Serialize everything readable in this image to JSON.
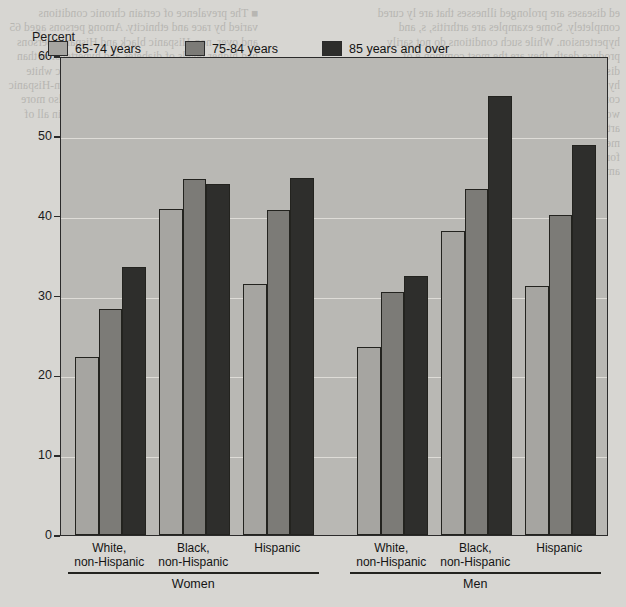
{
  "chart_data": {
    "type": "bar",
    "title": "",
    "xlabel": "",
    "ylabel": "Percent",
    "ylim": [
      0,
      60
    ],
    "yticks": [
      0,
      10,
      20,
      30,
      40,
      50,
      60
    ],
    "grid": true,
    "legend_position": "top-inside",
    "categories": [
      "White, non-Hispanic",
      "Black, non-Hispanic",
      "Hispanic",
      "White, non-Hispanic",
      "Black, non-Hispanic",
      "Hispanic"
    ],
    "panels": [
      {
        "name": "Women",
        "categories": [
          "White, non-Hispanic",
          "Black, non-Hispanic",
          "Hispanic"
        ]
      },
      {
        "name": "Men",
        "categories": [
          "White, non-Hispanic",
          "Black, non-Hispanic",
          "Hispanic"
        ]
      }
    ],
    "series": [
      {
        "name": "65-74 years",
        "color": "#a6a5a1",
        "values": [
          22.3,
          40.8,
          31.5,
          23.6,
          38.1,
          31.2
        ]
      },
      {
        "name": "75-84 years",
        "color": "#7c7b77",
        "values": [
          28.3,
          44.6,
          40.7,
          30.4,
          43.4,
          40.1
        ]
      },
      {
        "name": "85 years and over",
        "color": "#2e2e2c",
        "values": [
          33.6,
          44.0,
          44.7,
          32.5,
          55.0,
          48.9
        ]
      }
    ]
  },
  "axis": {
    "y_title": "Percent",
    "ticks": [
      "60",
      "50",
      "40",
      "30",
      "20",
      "10",
      "0"
    ]
  },
  "legend": {
    "items": [
      {
        "label": "65-74 years"
      },
      {
        "label": "75-84 years"
      },
      {
        "label": "85 years and over"
      }
    ]
  },
  "xaxis": {
    "groups": [
      {
        "line1": "White,",
        "line2": "non-Hispanic"
      },
      {
        "line1": "Black,",
        "line2": "non-Hispanic"
      },
      {
        "line1": "Hispanic",
        "line2": ""
      },
      {
        "line1": "White,",
        "line2": "non-Hispanic"
      },
      {
        "line1": "Black,",
        "line2": "non-Hispanic"
      },
      {
        "line1": "Hispanic",
        "line2": ""
      }
    ],
    "panels": [
      {
        "label": "Women"
      },
      {
        "label": "Men"
      }
    ]
  },
  "colors": {
    "page_background": "#d7d6d2",
    "plot_background": "#b9b8b4",
    "gridline": "#dedcd7",
    "axis": "#23231f",
    "series_65_74": "#a6a5a1",
    "series_75_84": "#7c7b77",
    "series_85_over": "#2e2e2c"
  },
  "bleed_text": {
    "left": "■  The prevalence of certain chronic conditions varied by race and ethnicity. Among persons aged 65 and over, non-Hispanic black and Hispanic persons had higher levels of diabetes and hypertension than non-Hispanic white persons. Non-Hispanic white persons had higher rates of cancer than non-Hispanic black or Hispanic persons. Arthritis was also more common among women than among men in all of the groups examined in this report.",
    "right": "ed diseases are prolonged illnesses that are ly cured completely. Some examples are arthritis, s, and hypertension. While such conditions do not sarily produce death, they are the most common e of disability. Among persons aged 70 and over, itis and hypertension were the most frequently rted chronic conditions for both women and men. ercent of women and 21 percent of men aged 70 ver reported arthritis and about 36 percent of n and 30 percent of men reported hypertension. they currently had some form of cancer. Levels of e and cancer were higher among men than their"
  }
}
